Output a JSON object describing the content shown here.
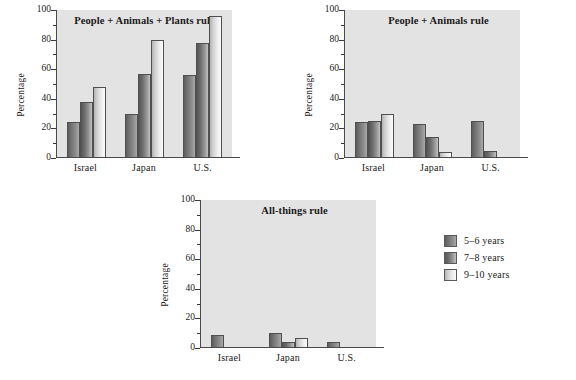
{
  "chart_data": [
    {
      "type": "bar",
      "title": "People + Animals + Plants rule",
      "xlabel": "",
      "ylabel": "Percentage",
      "ylim": [
        0,
        100
      ],
      "ytick_labels": [
        "0",
        "20",
        "40",
        "60",
        "80",
        "100"
      ],
      "ytick_values": [
        0,
        20,
        40,
        60,
        80,
        100
      ],
      "minor_tick_values": [
        10,
        30,
        50,
        70,
        90
      ],
      "grid": false,
      "categories": [
        "Israel",
        "Japan",
        "U.S."
      ],
      "series": [
        {
          "name": "5–6 years",
          "values": [
            24,
            30,
            56
          ]
        },
        {
          "name": "7–8 years",
          "values": [
            38,
            57,
            78
          ]
        },
        {
          "name": "9–10 years",
          "values": [
            48,
            80,
            96
          ]
        }
      ]
    },
    {
      "type": "bar",
      "title": "People + Animals rule",
      "xlabel": "",
      "ylabel": "Percentage",
      "ylim": [
        0,
        100
      ],
      "ytick_labels": [
        "0",
        "20",
        "40",
        "60",
        "80",
        "100"
      ],
      "ytick_values": [
        0,
        20,
        40,
        60,
        80,
        100
      ],
      "minor_tick_values": [
        10,
        30,
        50,
        70,
        90
      ],
      "grid": false,
      "categories": [
        "Israel",
        "Japan",
        "U.S."
      ],
      "series": [
        {
          "name": "5–6 years",
          "values": [
            24,
            23,
            25
          ]
        },
        {
          "name": "7–8 years",
          "values": [
            25,
            14,
            5
          ]
        },
        {
          "name": "9–10 years",
          "values": [
            30,
            4,
            0
          ]
        }
      ]
    },
    {
      "type": "bar",
      "title": "All-things rule",
      "xlabel": "",
      "ylabel": "Percentage",
      "ylim": [
        0,
        100
      ],
      "ytick_labels": [
        "0",
        "20",
        "40",
        "60",
        "80",
        "100"
      ],
      "ytick_values": [
        0,
        20,
        40,
        60,
        80,
        100
      ],
      "minor_tick_values": [
        10,
        30,
        50,
        70,
        90
      ],
      "grid": false,
      "categories": [
        "Israel",
        "Japan",
        "U.S."
      ],
      "series": [
        {
          "name": "5–6 years",
          "values": [
            9,
            10,
            4
          ]
        },
        {
          "name": "7–8 years",
          "values": [
            0,
            4,
            0
          ]
        },
        {
          "name": "9–10 years",
          "values": [
            0,
            7,
            0
          ]
        }
      ]
    }
  ],
  "legend": {
    "position": "right",
    "entries": [
      {
        "label": "5–6 years",
        "color": "#6f6f6f"
      },
      {
        "label": "7–8 years",
        "color": "#7a7a7a"
      },
      {
        "label": "9–10 years",
        "color": "#dcdcdc"
      }
    ]
  },
  "colors": {
    "plot_background": "#e3e3e3",
    "page_background": "#ffffff",
    "axis": "#4a4a4a",
    "text": "#1a1a1a"
  }
}
